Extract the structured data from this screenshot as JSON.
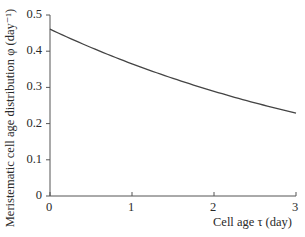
{
  "chart_data": {
    "type": "line",
    "title": "",
    "xlabel": "Cell age  τ (day)",
    "ylabel": "Meristematic cell age distribution φ (day⁻¹)",
    "xlim": [
      0,
      3
    ],
    "ylim": [
      0,
      0.5
    ],
    "x_ticks": [
      "0",
      "1",
      "2",
      "3"
    ],
    "y_ticks": [
      "0",
      "0.1",
      "0.2",
      "0.3",
      "0.4",
      "0.5"
    ],
    "grid": false,
    "legend": null,
    "series": [
      {
        "name": "φ(τ)",
        "x": [
          0,
          0.5,
          1,
          1.5,
          2,
          2.5,
          3
        ],
        "y": [
          0.461,
          0.415,
          0.373,
          0.332,
          0.295,
          0.26,
          0.229
        ]
      }
    ]
  },
  "axes": {
    "xlabel": "Cell age  τ (day)",
    "ylabel": "Meristematic cell age distribution φ (day⁻¹)",
    "x_ticks": [
      "0",
      "1",
      "2",
      "3"
    ],
    "y_ticks": [
      "0",
      "0.1",
      "0.2",
      "0.3",
      "0.4",
      "0.5"
    ]
  }
}
